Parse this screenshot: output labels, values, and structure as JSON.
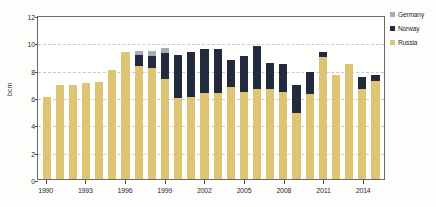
{
  "chart_data": {
    "type": "bar",
    "stacked": true,
    "title": "",
    "subtitle": "",
    "xlabel": "",
    "ylabel": "bcm",
    "ylim": [
      0,
      12
    ],
    "ytick_values": [
      0,
      2,
      4,
      6,
      8,
      10,
      12
    ],
    "ytick_labels": [
      "0",
      "2",
      "4",
      "6",
      "8",
      "10",
      "12"
    ],
    "grid": true,
    "grid_axis": "y",
    "legend_position": "right",
    "categories": [
      "1990",
      "1991",
      "1992",
      "1993",
      "1994",
      "1995",
      "1996",
      "1997",
      "1998",
      "1999",
      "2000",
      "2001",
      "2002",
      "2003",
      "2004",
      "2005",
      "2006",
      "2007",
      "2008",
      "2009",
      "2010",
      "2011",
      "2012",
      "2013",
      "2014",
      "2015"
    ],
    "xtick_labels": [
      "1990",
      "1993",
      "1996",
      "1999",
      "2002",
      "2005",
      "2008",
      "2011",
      "2014"
    ],
    "xtick_categories": [
      "1990",
      "1993",
      "1996",
      "1999",
      "2002",
      "2005",
      "2008",
      "2011",
      "2014"
    ],
    "series": [
      {
        "name": "Russia",
        "color": "#dec576",
        "values": [
          6.0,
          6.9,
          6.9,
          7.0,
          7.1,
          8.0,
          9.3,
          8.3,
          8.1,
          7.3,
          5.9,
          6.0,
          6.3,
          6.3,
          6.7,
          6.4,
          6.6,
          6.6,
          6.4,
          4.8,
          6.2,
          8.9,
          7.6,
          8.4,
          6.6,
          7.2
        ]
      },
      {
        "name": "Norway",
        "color": "#222a3d",
        "values": [
          0.0,
          0.0,
          0.0,
          0.0,
          0.0,
          0.0,
          0.0,
          0.8,
          0.9,
          1.9,
          3.2,
          3.3,
          3.2,
          3.2,
          2.0,
          2.6,
          3.1,
          1.9,
          2.0,
          2.1,
          1.6,
          0.4,
          0.0,
          0.0,
          0.9,
          0.4
        ]
      },
      {
        "name": "Germany",
        "color": "#a9abb2",
        "values": [
          0.0,
          0.0,
          0.0,
          0.0,
          0.0,
          0.0,
          0.0,
          0.3,
          0.4,
          0.4,
          0.0,
          0.0,
          0.0,
          0.0,
          0.0,
          0.0,
          0.0,
          0.0,
          0.0,
          0.0,
          0.0,
          0.0,
          0.0,
          0.0,
          0.0,
          0.0
        ]
      }
    ]
  },
  "legend": {
    "items": [
      {
        "label": "Germany",
        "color": "#a9abb2"
      },
      {
        "label": "Norway",
        "color": "#222a3d"
      },
      {
        "label": "Russia",
        "color": "#dec576"
      }
    ]
  }
}
